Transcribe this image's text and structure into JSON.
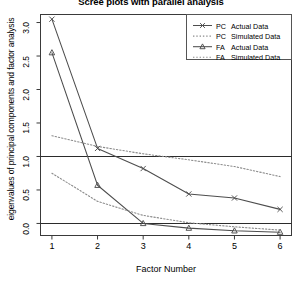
{
  "chart_data": {
    "type": "line",
    "title": "Scree plots with parallel analysis",
    "xlabel": "Factor Number",
    "ylabel": "eigenvalues of principal components and factor analysis",
    "x": [
      1,
      2,
      3,
      4,
      5,
      6
    ],
    "xticklabels": [
      "1",
      "2",
      "3",
      "4",
      "5",
      "6"
    ],
    "yticklabels": [
      "0.0",
      "0.5",
      "1.0",
      "1.5",
      "2.0",
      "2.5",
      "3.0"
    ],
    "yticks": [
      0.0,
      0.5,
      1.0,
      1.5,
      2.0,
      2.5,
      3.0
    ],
    "xlim": [
      0.75,
      6.25
    ],
    "ylim": [
      -0.18,
      3.12
    ],
    "grid": false,
    "legend_position": "top-right",
    "reference_lines": [
      {
        "y": 1.0,
        "style": "solid",
        "name": "eigenvalue-one-line"
      },
      {
        "y": 0.0,
        "style": "solid",
        "name": "zero-line"
      }
    ],
    "series": [
      {
        "name": "PC  Actual Data",
        "key": "pc_actual",
        "marker": "x",
        "linestyle": "solid",
        "color": "#4d4d4d",
        "values": [
          3.05,
          1.12,
          0.82,
          0.44,
          0.38,
          0.21
        ]
      },
      {
        "name": "PC  Simulated Data",
        "key": "pc_simulated",
        "marker": "none",
        "linestyle": "dotted",
        "color": "#8c8c8c",
        "values": [
          1.31,
          1.15,
          1.04,
          0.95,
          0.85,
          0.7
        ]
      },
      {
        "name": "FA  Actual Data",
        "key": "fa_actual",
        "marker": "triangle",
        "linestyle": "solid",
        "color": "#4d4d4d",
        "values": [
          2.55,
          0.57,
          0.0,
          -0.07,
          -0.11,
          -0.13
        ]
      },
      {
        "name": "FA  Simulated Data",
        "key": "fa_simulated",
        "marker": "none",
        "linestyle": "dotted",
        "color": "#8c8c8c",
        "values": [
          0.75,
          0.33,
          0.12,
          0.01,
          -0.05,
          -0.1
        ]
      }
    ]
  },
  "legend": {
    "items": [
      {
        "group": "PC",
        "label": "Actual Data",
        "marker": "x",
        "linestyle": "solid"
      },
      {
        "group": "PC",
        "label": "Simulated Data",
        "marker": "none",
        "linestyle": "dotted"
      },
      {
        "group": "FA",
        "label": "Actual Data",
        "marker": "triangle",
        "linestyle": "solid"
      },
      {
        "group": "FA",
        "label": "Simulated Data",
        "marker": "none",
        "linestyle": "dotted"
      }
    ]
  }
}
